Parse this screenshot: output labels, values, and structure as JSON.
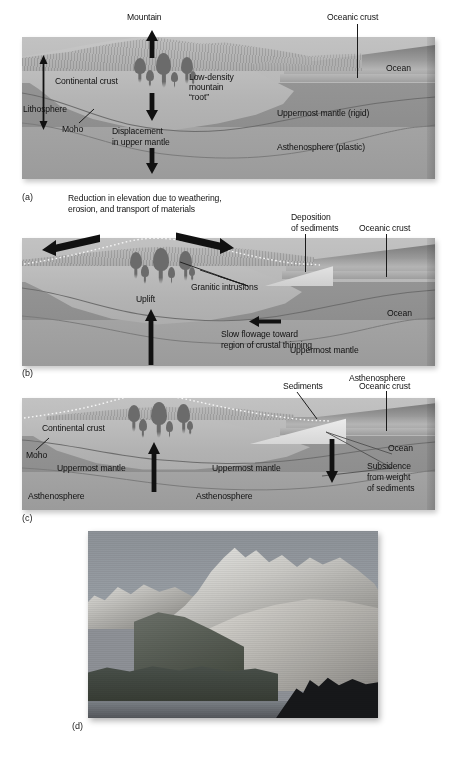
{
  "figure": {
    "type": "geology-cross-section-figure",
    "title_visible": false,
    "panel_letters": [
      "(a)",
      "(b)",
      "(c)",
      "(d)"
    ]
  },
  "panel_a": {
    "letter": "(a)",
    "labels": {
      "mountain": "Mountain",
      "oceanic_crust": "Oceanic crust",
      "ocean": "Ocean",
      "continental_crust": "Continental crust",
      "low_density_root_line1": "Low-density",
      "low_density_root_line2": "mountain",
      "low_density_root_line3": "“root”",
      "lithosphere": "Lithosphere",
      "moho": "Moho",
      "displacement_line1": "Displacement",
      "displacement_line2": "in upper mantle",
      "uppermost_mantle": "Uppermost mantle (rigid)",
      "asthenosphere": "Asthenosphere (plastic)"
    }
  },
  "panel_b": {
    "letter": "(b)",
    "labels": {
      "caption_line1": "Reduction in elevation due to weathering,",
      "caption_line2": "erosion, and transport of materials",
      "deposition_line1": "Deposition",
      "deposition_line2": "of sediments",
      "oceanic_crust": "Oceanic crust",
      "ocean": "Ocean",
      "granitic_intrusions": "Granitic intrusions",
      "uppermost_mantle": "Uppermost mantle",
      "asthenosphere": "Asthenosphere",
      "uplift": "Uplift",
      "slow_flowage_line1": "Slow flowage toward",
      "slow_flowage_line2": "region of crustal thinning"
    }
  },
  "panel_c": {
    "letter": "(c)",
    "labels": {
      "sediments": "Sediments",
      "oceanic_crust": "Oceanic crust",
      "ocean": "Ocean",
      "continental_crust": "Continental crust",
      "moho": "Moho",
      "uppermost_mantle_left": "Uppermost mantle",
      "uppermost_mantle_right": "Uppermost mantle",
      "asthenosphere_left": "Asthenosphere",
      "asthenosphere_right": "Asthenosphere",
      "subsidence_line1": "Subsidence",
      "subsidence_line2": "from weight",
      "subsidence_line3": "of sediments"
    }
  },
  "panel_d": {
    "letter": "(d)",
    "photo_alt": "Granitic mountain range above an alpine lake"
  },
  "colors": {
    "continental_crust": "#bcbcbc",
    "uppermost_mantle": "#919191",
    "asthenosphere": "#9f9f9f",
    "ocean_water": "#a9a9a9",
    "pluton": "#6b6b6b",
    "arrow": "#111111",
    "text": "#121212",
    "page_background": "#ffffff"
  }
}
